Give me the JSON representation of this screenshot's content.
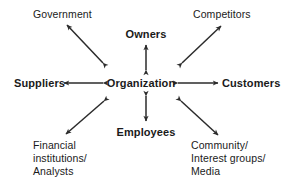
{
  "diagram": {
    "type": "stakeholder-map",
    "background_color": "#ffffff",
    "line_color": "#2b2b2b",
    "text_color": "#1a1a1a",
    "center": {
      "id": "organization",
      "label": "Organization",
      "weight": "bold"
    },
    "primary_nodes": [
      {
        "id": "owners",
        "label": "Owners",
        "position": "top",
        "weight": "bold"
      },
      {
        "id": "suppliers",
        "label": "Suppliers",
        "position": "left",
        "weight": "bold"
      },
      {
        "id": "customers",
        "label": "Customers",
        "position": "right",
        "weight": "bold"
      },
      {
        "id": "employees",
        "label": "Employees",
        "position": "bottom",
        "weight": "bold"
      }
    ],
    "secondary_nodes": [
      {
        "id": "government",
        "position": "top-left",
        "weight": "normal",
        "lines": [
          "Government"
        ]
      },
      {
        "id": "competitors",
        "position": "top-right",
        "weight": "normal",
        "lines": [
          "Competitors"
        ]
      },
      {
        "id": "financial-institutions-analysts",
        "position": "bottom-left",
        "weight": "normal",
        "lines": [
          "Financial",
          "institutions/",
          "Analysts"
        ]
      },
      {
        "id": "community-interest-groups-media",
        "position": "bottom-right",
        "weight": "normal",
        "lines": [
          "Community/",
          "Interest groups/",
          "Media"
        ]
      }
    ],
    "connectors": [
      {
        "id": "organization-owners",
        "from": "organization",
        "to": "owners",
        "style": "double-arrow",
        "orientation": "vertical"
      },
      {
        "id": "organization-employees",
        "from": "organization",
        "to": "employees",
        "style": "double-arrow",
        "orientation": "vertical"
      },
      {
        "id": "organization-suppliers",
        "from": "organization",
        "to": "suppliers",
        "style": "double-arrow",
        "orientation": "horizontal"
      },
      {
        "id": "organization-customers",
        "from": "organization",
        "to": "customers",
        "style": "double-arrow",
        "orientation": "horizontal"
      },
      {
        "id": "organization-government",
        "from": "organization",
        "to": "government",
        "style": "double-arrow",
        "orientation": "diagonal"
      },
      {
        "id": "organization-competitors",
        "from": "organization",
        "to": "competitors",
        "style": "double-arrow",
        "orientation": "diagonal"
      },
      {
        "id": "organization-financial",
        "from": "organization",
        "to": "financial-institutions-analysts",
        "style": "double-arrow",
        "orientation": "diagonal"
      },
      {
        "id": "organization-community",
        "from": "organization",
        "to": "community-interest-groups-media",
        "style": "double-arrow",
        "orientation": "diagonal"
      }
    ]
  }
}
